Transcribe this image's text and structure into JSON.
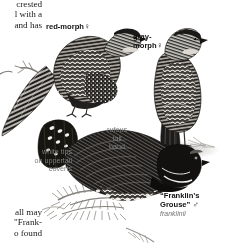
{
  "plate": {
    "title": "Spruce Grouse field guide plate",
    "subject": "Spruce Grouse / \"Franklin's Grouse\"",
    "background_color": "#ffffff",
    "ink_color": "#1b1b1b",
    "leader_color": "#7d7d7d"
  },
  "body_text": {
    "top_column_lines": "crested\nl with a\nand has",
    "bottom_column_lines": "all may\n\"Frank-\no found"
  },
  "labels": {
    "red_morph": "red-morph",
    "red_morph_sex": "♀",
    "gray_morph": "gray-\nmorph",
    "gray_morph_sex": "♀",
    "rufous_tail_band": "rufous\ntail\nband",
    "white_tips": "white tips\non uppertail\ncoverts",
    "franklins_grouse": "“Franklin’s\nGrouse”",
    "franklins_sex": "♂",
    "franklins_scientific": "franklinii"
  },
  "figures": [
    {
      "name": "red-morph-female-grouse",
      "label": "red-morph ♀",
      "pose": "perched on branch, facing right, back view"
    },
    {
      "name": "gray-morph-female-grouse",
      "label": "gray-morph ♀",
      "pose": "standing upright, facing right, back view"
    },
    {
      "name": "franklins-grouse-male",
      "label": "“Franklin’s Grouse” ♂",
      "pose": "displaying on ground, facing right, fanned tail at left"
    }
  ]
}
